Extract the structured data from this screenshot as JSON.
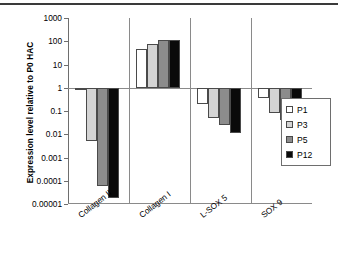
{
  "chart_data": {
    "type": "bar",
    "title": "",
    "xlabel": "",
    "ylabel": "Expression level relative to P0 HAC",
    "yscale": "log",
    "ylim": [
      1e-05,
      1000
    ],
    "ytick_labels": [
      "1000",
      "100",
      "10",
      "1",
      "0.1",
      "0.01",
      "0.001",
      "0.0001",
      "0.00001"
    ],
    "ytick_values": [
      1000,
      100,
      10,
      1,
      0.1,
      0.01,
      0.001,
      0.0001,
      1e-05
    ],
    "grid": false,
    "legend_position": "right",
    "categories": [
      "Collagen II",
      "Collagen I",
      "L-SOX 5",
      "SOX 9"
    ],
    "series": [
      {
        "name": "P1",
        "color": "#ffffff",
        "values": [
          1.0,
          45,
          0.2,
          0.35
        ]
      },
      {
        "name": "P3",
        "color": "#d4d4d4",
        "values": [
          0.005,
          75,
          0.05,
          0.08
        ]
      },
      {
        "name": "P5",
        "color": "#8c8c8c",
        "values": [
          6e-05,
          110,
          0.025,
          0.04
        ]
      },
      {
        "name": "P12",
        "color": "#0a0a0a",
        "values": [
          1.8e-05,
          115,
          0.011,
          0.013
        ]
      }
    ]
  },
  "legend": {
    "items": [
      {
        "label": "P1"
      },
      {
        "label": "P3"
      },
      {
        "label": "P5"
      },
      {
        "label": "P12"
      }
    ]
  }
}
